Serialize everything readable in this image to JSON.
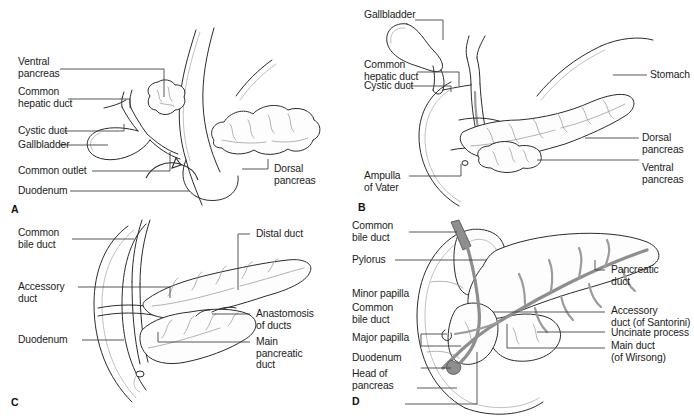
{
  "figure": {
    "background_color": "#ffffff",
    "line_color": "#2b2b2b",
    "duct_shade_color": "#8e8e8e"
  },
  "panels": [
    {
      "id": "A",
      "letter": "A",
      "labels_left": [
        {
          "key": "ventral_pancreas",
          "text": "Ventral\npancreas"
        },
        {
          "key": "common_hepatic_duct",
          "text": "Common\nhepatic duct"
        },
        {
          "key": "cystic_duct",
          "text": "Cystic duct"
        },
        {
          "key": "gallbladder",
          "text": "Gallbladder"
        },
        {
          "key": "common_outlet",
          "text": "Common outlet"
        },
        {
          "key": "duodenum",
          "text": "Duodenum"
        }
      ],
      "labels_right": [
        {
          "key": "dorsal_pancreas",
          "text": "Dorsal\npancreas"
        }
      ]
    },
    {
      "id": "B",
      "letter": "B",
      "labels_left": [
        {
          "key": "gallbladder",
          "text": "Gallbladder"
        },
        {
          "key": "common_hepatic_duct",
          "text": "Common\nhepatic duct"
        },
        {
          "key": "cystic_duct",
          "text": "Cystic duct"
        },
        {
          "key": "ampulla_of_vater",
          "text": "Ampulla\nof Vater"
        }
      ],
      "labels_right": [
        {
          "key": "stomach",
          "text": "Stomach"
        },
        {
          "key": "dorsal_pancreas",
          "text": "Dorsal\npancreas"
        },
        {
          "key": "ventral_pancreas",
          "text": "Ventral\npancreas"
        }
      ]
    },
    {
      "id": "C",
      "letter": "C",
      "labels_left": [
        {
          "key": "common_bile_duct",
          "text": "Common\nbile duct"
        },
        {
          "key": "accessory_duct",
          "text": "Accessory\nduct"
        },
        {
          "key": "duodenum",
          "text": "Duodenum"
        }
      ],
      "labels_right": [
        {
          "key": "distal_duct",
          "text": "Distal duct"
        },
        {
          "key": "anastomosis_of_ducts",
          "text": "Anastomosis\nof ducts"
        },
        {
          "key": "main_pancreatic_duct",
          "text": "Main\npancreatic\nduct"
        }
      ]
    },
    {
      "id": "D",
      "letter": "D",
      "labels_left": [
        {
          "key": "common_bile_duct_top",
          "text": "Common\nbile duct"
        },
        {
          "key": "pylorus",
          "text": "Pylorus"
        },
        {
          "key": "minor_papilla",
          "text": "Minor papilla"
        },
        {
          "key": "common_bile_duct_mid",
          "text": "Common\nbile duct"
        },
        {
          "key": "major_papilla",
          "text": "Major papilla"
        },
        {
          "key": "duodenum",
          "text": "Duodenum"
        },
        {
          "key": "head_of_pancreas",
          "text": "Head of\npancreas"
        }
      ],
      "labels_right": [
        {
          "key": "pancreatic_duct",
          "text": "Pancreatic\nduct"
        },
        {
          "key": "accessory_duct_santorini",
          "text": "Accessory\nduct (of Santorini)"
        },
        {
          "key": "uncinate_process",
          "text": "Uncinate process"
        },
        {
          "key": "main_duct_wirsong",
          "text": "Main duct\n(of Wirsong)"
        }
      ]
    }
  ]
}
